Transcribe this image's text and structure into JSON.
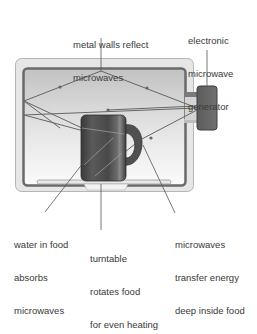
{
  "diagram": {
    "labels": {
      "walls": [
        "metal walls reflect",
        "microwaves"
      ],
      "generator": [
        "electronic",
        "microwave",
        "generator"
      ],
      "water": [
        "water in food",
        "absorbs",
        "microwaves"
      ],
      "turntable": [
        "turntable",
        "rotates food",
        "for even heating"
      ],
      "transfer": [
        "microwaves",
        "transfer energy",
        "deep inside food"
      ]
    },
    "colors": {
      "outer_case": "#e4e4e4",
      "outer_border": "#b8b8b8",
      "metal_wall": "#6e6e6e",
      "cavity_top": "#c4c4c4",
      "cavity_bottom": "#fafafa",
      "generator": "#6a6a6a",
      "mug": "#4a4a4a",
      "ray": "#6a6a6a",
      "leader_line": "#555555",
      "text": "#3a3a3a"
    }
  }
}
